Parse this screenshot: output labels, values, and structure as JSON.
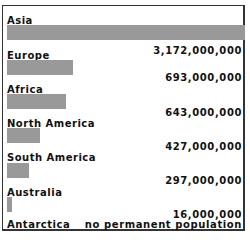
{
  "chart_data": {
    "type": "bar",
    "orientation": "horizontal",
    "title": "",
    "xlabel": "",
    "ylabel": "",
    "categories": [
      "Asia",
      "Europe",
      "Africa",
      "North America",
      "South America",
      "Australia",
      "Antarctica"
    ],
    "values": [
      3172000000,
      693000000,
      643000000,
      427000000,
      297000000,
      16000000,
      0
    ],
    "value_labels": [
      "3,172,000,000",
      "693,000,000",
      "643,000,000",
      "427,000,000",
      "297,000,000",
      "16,000,000",
      "no permanent population"
    ],
    "bar_color": "#999999",
    "grid": false,
    "legend": null
  },
  "rows": [
    {
      "label": "Asia",
      "value_label": "3,172,000,000",
      "bar_width": 238,
      "label_top": 15,
      "bar_top": 25,
      "value_top": 45
    },
    {
      "label": "Europe",
      "value_label": "693,000,000",
      "bar_width": 66,
      "label_top": 50,
      "bar_top": 60,
      "value_top": 72
    },
    {
      "label": "Africa",
      "value_label": "643,000,000",
      "bar_width": 59,
      "label_top": 84,
      "bar_top": 94,
      "value_top": 107
    },
    {
      "label": "North America",
      "value_label": "427,000,000",
      "bar_width": 33,
      "label_top": 118,
      "bar_top": 128,
      "value_top": 141
    },
    {
      "label": "South America",
      "value_label": "297,000,000",
      "bar_width": 22,
      "label_top": 152,
      "bar_top": 163,
      "value_top": 175
    },
    {
      "label": "Australia",
      "value_label": "16,000,000",
      "bar_width": 5,
      "label_top": 187,
      "bar_top": 197,
      "value_top": 209
    },
    {
      "label": "Antarctica",
      "value_label": "no permanent population",
      "bar_width": 0,
      "label_top": 219,
      "bar_top": null,
      "value_top": 219
    }
  ]
}
